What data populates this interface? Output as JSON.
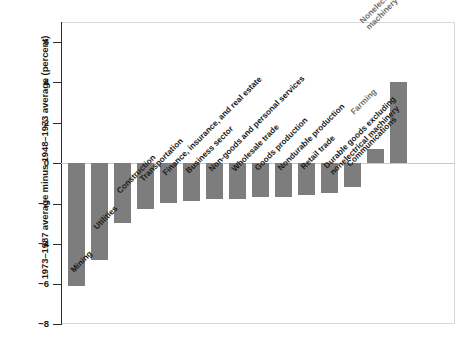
{
  "chart_data": {
    "type": "bar",
    "title": "",
    "xlabel": "",
    "ylabel": "1973–1987 average minus 1948–1973 average (percent)",
    "ylim": [
      -8,
      7
    ],
    "yticks": [
      6,
      4,
      2,
      0,
      -2,
      -4,
      -6,
      -8
    ],
    "ytick_labels": [
      "6",
      "4",
      "2",
      "0",
      "−2",
      "−4",
      "−6",
      "−8"
    ],
    "grid": false,
    "legend": null,
    "bar_color": "#7d7d7d",
    "categories": [
      "Mining",
      "Utilities",
      "Construction",
      "Transportation",
      "Finance, insurance, and real estate",
      "Business sector",
      "Non-goods and personal services",
      "Wholesale trade",
      "Goods production",
      "Nondurable production",
      "Retail trade",
      "Durable goods excluding nonelectrical machinery",
      "Communications",
      "Farming",
      "Nonelectrical machinery"
    ],
    "values": [
      -6.1,
      -4.8,
      -3.0,
      -2.3,
      -2.0,
      -1.9,
      -1.8,
      -1.8,
      -1.7,
      -1.7,
      -1.6,
      -1.5,
      -1.2,
      0.7,
      4.0
    ]
  },
  "axis": {
    "y_title": "1973–1987 average minus 1948–1973 average (percent)",
    "tick_0": "6",
    "tick_1": "4",
    "tick_2": "2",
    "tick_3": "0",
    "tick_4": "−2",
    "tick_5": "−4",
    "tick_6": "−6",
    "tick_7": "−8"
  },
  "labels": {
    "l0": "Mining",
    "l1": "Utilities",
    "l2": "Construction",
    "l3": "Transportation",
    "l4": "Finance, insurance, and real estate",
    "l5": "Business sector",
    "l6": "Non-goods and personal services",
    "l7": "Wholesale trade",
    "l8": "Goods production",
    "l9": "Nondurable production",
    "l10": "Retail trade",
    "l11a": "Durable goods excluding",
    "l11b": "nonelectrical machinery",
    "l12": "Communications",
    "l13": "Farming",
    "l14a": "Nonelectrical",
    "l14b": "machinery"
  }
}
